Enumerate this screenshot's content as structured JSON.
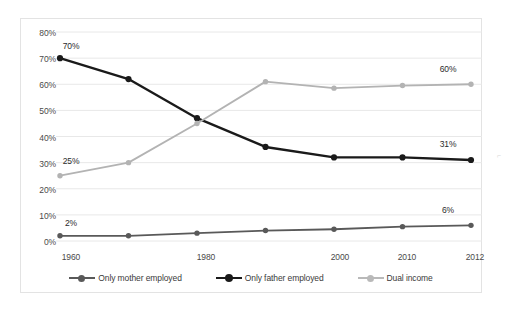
{
  "chart_data": {
    "type": "line",
    "title": "",
    "subtitle": "",
    "xlabel": "",
    "ylabel": "",
    "x": [
      1960,
      1970,
      1980,
      1990,
      2000,
      2010,
      2012
    ],
    "categories": [
      "1960",
      "1970",
      "1980",
      "1990",
      "2000",
      "2010",
      "2012"
    ],
    "x_tick_labels_shown": [
      "1960",
      "1980",
      "2000",
      "2010",
      "2012"
    ],
    "y_tick_labels": [
      "0%",
      "10%",
      "20%",
      "30%",
      "40%",
      "50%",
      "60%",
      "70%",
      "80%"
    ],
    "ylim": [
      0,
      80
    ],
    "ytick_step": 10,
    "grid": true,
    "grid_axis": "y",
    "legend_position": "bottom",
    "series": [
      {
        "name": "Only mother employed",
        "color": "#595959",
        "values": [
          2,
          2,
          3,
          4,
          4.5,
          5.5,
          6
        ],
        "labels": [
          {
            "index": 0,
            "text": "2%"
          },
          {
            "index": 6,
            "text": "6%"
          }
        ]
      },
      {
        "name": "Only father employed",
        "color": "#1a1a1a",
        "values": [
          70,
          62,
          47,
          36,
          32,
          32,
          31
        ],
        "labels": [
          {
            "index": 0,
            "text": "70%"
          },
          {
            "index": 6,
            "text": "31%"
          }
        ]
      },
      {
        "name": "Dual income",
        "color": "#b3b3b3",
        "values": [
          25,
          30,
          45,
          61,
          58.5,
          59.5,
          60
        ],
        "labels": [
          {
            "index": 0,
            "text": "25%"
          },
          {
            "index": 6,
            "text": "60%"
          }
        ]
      }
    ]
  },
  "legend": {
    "items": [
      {
        "label": "Only mother employed",
        "color": "#595959"
      },
      {
        "label": "Only father employed",
        "color": "#1a1a1a"
      },
      {
        "label": "Dual income",
        "color": "#b3b3b3"
      }
    ]
  },
  "axes": {
    "y_ticks": [
      {
        "label": "80%",
        "value": 80
      },
      {
        "label": "70%",
        "value": 70
      },
      {
        "label": "60%",
        "value": 60
      },
      {
        "label": "50%",
        "value": 50
      },
      {
        "label": "40%",
        "value": 40
      },
      {
        "label": "30%",
        "value": 30
      },
      {
        "label": "20%",
        "value": 20
      },
      {
        "label": "10%",
        "value": 10
      },
      {
        "label": "0%",
        "value": 0
      }
    ],
    "x_ticks": [
      {
        "label": "1960",
        "value": 1960
      },
      {
        "label": "1980",
        "value": 1980
      },
      {
        "label": "2000",
        "value": 2000
      },
      {
        "label": "2010",
        "value": 2010
      },
      {
        "label": "2012",
        "value": 2012
      }
    ]
  },
  "point_labels": [
    {
      "text": "70%",
      "series": "Only father employed"
    },
    {
      "text": "25%",
      "series": "Dual income"
    },
    {
      "text": "2%",
      "series": "Only mother employed"
    },
    {
      "text": "60%",
      "series": "Dual income"
    },
    {
      "text": "31%",
      "series": "Only father employed"
    },
    {
      "text": "6%",
      "series": "Only mother employed"
    }
  ],
  "colors": {
    "grid": "#e8e8e8",
    "frame": "#e3e3e3",
    "text": "#4a4a4a",
    "background": "#ffffff"
  }
}
